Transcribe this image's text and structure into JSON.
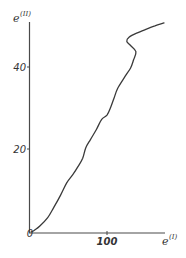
{
  "chart_data": {
    "type": "line",
    "title": "",
    "xlabel": "e(I)",
    "ylabel": "e(II)",
    "xlim": [
      0,
      175
    ],
    "ylim": [
      0,
      51
    ],
    "grid": false,
    "legend": null,
    "x_ticks": [
      {
        "value": 100,
        "label": "100"
      }
    ],
    "y_ticks": [
      {
        "value": 0,
        "label": "0"
      },
      {
        "value": 20,
        "label": "20"
      },
      {
        "value": 40,
        "label": "40"
      }
    ],
    "series": [
      {
        "name": "e(II) vs e(I)",
        "x": [
          0,
          5,
          12,
          22,
          30,
          39,
          47,
          55,
          62,
          68,
          72,
          78,
          86,
          93,
          100,
          105,
          109,
          114,
          124,
          131,
          135,
          138,
          131,
          126,
          129,
          139,
          152,
          163,
          175
        ],
        "y": [
          0,
          0.5,
          1.5,
          3.5,
          6,
          9,
          12,
          14,
          16,
          18,
          20.5,
          22.5,
          25,
          27.5,
          28.5,
          30.5,
          32.5,
          35,
          38,
          40,
          42,
          44,
          45.5,
          46.5,
          47.5,
          48.5,
          49.5,
          50.3,
          51
        ]
      }
    ]
  },
  "labels": {
    "y_axis_base": "e",
    "y_axis_sup": "(II)",
    "x_axis_base": "e",
    "x_axis_sup": "(I)",
    "tick_0": "0",
    "tick_20": "20",
    "tick_40": "40",
    "tick_100": "100"
  },
  "colors": {
    "line": "#3a3a3a",
    "axis": "#4a4a4a",
    "background": "#ffffff"
  }
}
